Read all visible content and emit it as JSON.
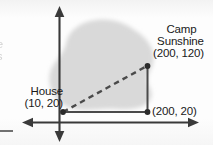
{
  "figure": {
    "axes": {
      "x_axis_name": "horizontal-axis",
      "y_axis_name": "vertical-axis",
      "origin_visible": false
    },
    "blob": {
      "name": "lake-shape",
      "fill": "#d9d9d9"
    },
    "points": [
      {
        "id": "house",
        "label": "House",
        "coords": "(10, 20)",
        "x": 10,
        "y": 20
      },
      {
        "id": "camp-sunshine",
        "label_line1": "Camp",
        "label_line2": "Sunshine",
        "coords": "(200, 120)",
        "x": 200,
        "y": 120
      },
      {
        "id": "corner",
        "label": "",
        "coords": "(200, 20)",
        "x": 200,
        "y": 20
      }
    ],
    "segments": [
      {
        "id": "hypotenuse",
        "style": "dashed",
        "from": "house",
        "to": "camp-sunshine"
      },
      {
        "id": "horizontal-leg",
        "style": "solid",
        "from": "house",
        "to": "corner"
      },
      {
        "id": "vertical-leg",
        "style": "solid",
        "from": "corner",
        "to": "camp-sunshine"
      }
    ],
    "colors": {
      "ink": "#191919",
      "line": "#3a3a3a",
      "blob": "#d9d9d9",
      "page": "#fdfdfd"
    },
    "edge_fragments": {
      "top": "e",
      "bottom": "s"
    }
  }
}
